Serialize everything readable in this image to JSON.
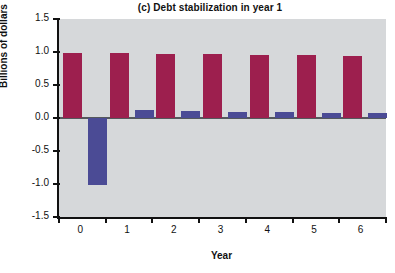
{
  "chart_data": {
    "type": "bar",
    "title": "(c) Debt stabilization in year 1",
    "xlabel": "Year",
    "ylabel": "Billions of dollars",
    "categories": [
      "0",
      "1",
      "2",
      "3",
      "4",
      "5",
      "6"
    ],
    "xtick_labels": [
      "0",
      "1",
      "2",
      "3",
      "4",
      "5",
      "6"
    ],
    "ytick_labels": [
      "1.5",
      "1.0",
      "0.5",
      "0.0",
      "-0.5",
      "-1.0",
      "-1.5"
    ],
    "ytick_values": [
      1.5,
      1.0,
      0.5,
      0.0,
      -0.5,
      -1.0,
      -1.5
    ],
    "ylim": [
      -1.5,
      1.5
    ],
    "grid": false,
    "legend": "none",
    "plot_background": "#d6d8da",
    "series": [
      {
        "name": "red-series",
        "color": "#9d1f4e",
        "values": [
          0.99,
          0.98,
          0.975,
          0.965,
          0.96,
          0.95,
          0.945
        ]
      },
      {
        "name": "blue-series",
        "color": "#4b4b95",
        "values": [
          -1.02,
          0.115,
          0.105,
          0.095,
          0.085,
          0.08,
          0.07
        ]
      }
    ]
  }
}
